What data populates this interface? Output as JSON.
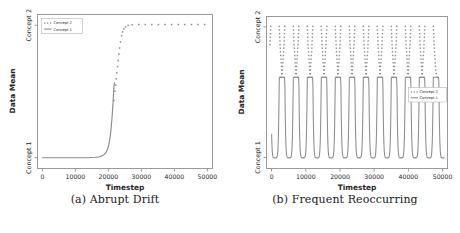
{
  "figure": {
    "panels": [
      {
        "id": "panel-a",
        "caption": "(a) Abrupt Drift",
        "legend_position": "upper-left"
      },
      {
        "id": "panel-b",
        "caption": "(b) Frequent Reoccurring",
        "legend_position": "center-right"
      }
    ]
  },
  "colors": {
    "line": "#8c8c8c",
    "dot": "#8c8c8c",
    "axis": "#9a9a9a",
    "text": "#262626",
    "background": "#ffffff"
  },
  "chart_data": [
    {
      "type": "line",
      "title": "(a) Abrupt Drift",
      "xlabel": "Timestep",
      "ylabel": "Data Mean",
      "xlim": [
        -1500,
        51500
      ],
      "ylim": [
        0,
        1
      ],
      "grid": false,
      "xticks": [
        0,
        10000,
        20000,
        30000,
        40000,
        50000
      ],
      "xticklabels": [
        "0",
        "10000",
        "20000",
        "30000",
        "40000",
        "50000"
      ],
      "yticks": [
        0.07,
        0.93
      ],
      "yticklabels": [
        "Concept 1",
        "Concept 2"
      ],
      "legend": [
        "Concept 2",
        "Concept 1"
      ],
      "legend_position": "upper-left",
      "series": [
        {
          "name": "Concept 1",
          "style": "solid",
          "description": "Flat at Concept 1 until ~21000, then sigmoid rise, truncated at ~25000 near mid-height",
          "x": [
            0,
            2000,
            4000,
            6000,
            8000,
            10000,
            12000,
            14000,
            16000,
            18000,
            19000,
            20000,
            21000,
            21500,
            22000,
            22500,
            23000,
            23400,
            23800,
            24100,
            24400,
            24600,
            24800,
            24950,
            25050
          ],
          "y": [
            0.07,
            0.07,
            0.07,
            0.07,
            0.07,
            0.07,
            0.07,
            0.07,
            0.071,
            0.072,
            0.073,
            0.075,
            0.079,
            0.083,
            0.09,
            0.102,
            0.125,
            0.155,
            0.205,
            0.265,
            0.345,
            0.41,
            0.48,
            0.53,
            0.555
          ]
        },
        {
          "name": "Concept 2",
          "style": "dotted",
          "description": "Dotted sigmoid continuing from ~24500 up to plateau at Concept 2 level across remainder",
          "x": [
            24500,
            24800,
            25000,
            25200,
            25400,
            25600,
            25800,
            26000,
            26200,
            26500,
            26800,
            27100,
            27500,
            28000,
            28800,
            30000,
            32000,
            34000,
            36000,
            38000,
            40000,
            42000,
            44000,
            46000,
            48000,
            50000
          ],
          "y": [
            0.44,
            0.5,
            0.54,
            0.58,
            0.62,
            0.66,
            0.7,
            0.74,
            0.78,
            0.82,
            0.86,
            0.885,
            0.905,
            0.918,
            0.927,
            0.932,
            0.933,
            0.933,
            0.933,
            0.933,
            0.933,
            0.933,
            0.933,
            0.933,
            0.933,
            0.933
          ]
        }
      ]
    },
    {
      "type": "line",
      "title": "(b) Frequent Reoccurring",
      "xlabel": "Timestep",
      "ylabel": "Data Mean",
      "xlim": [
        -1500,
        51500
      ],
      "ylim": [
        0,
        1
      ],
      "grid": false,
      "xticks": [
        0,
        10000,
        20000,
        30000,
        40000,
        50000
      ],
      "xticklabels": [
        "0",
        "10000",
        "20000",
        "30000",
        "40000",
        "50000"
      ],
      "yticks": [
        0.07,
        0.93
      ],
      "yticklabels": [
        "Concept 1",
        "Concept 2"
      ],
      "legend": [
        "Concept 2",
        "Concept 1"
      ],
      "legend_position": "center-right",
      "oscillation": {
        "cycles": 12,
        "period": 4100,
        "first_peak": 1000,
        "solid_top": 0.6,
        "solid_bottom": 0.07,
        "dot_top": 0.935,
        "dot_bottom": 0.6,
        "description": "12 repeating U-shaped troughs in solid Concept 1 line; dotted Concept 2 columns rise above each peak to the Concept 2 plateau level"
      }
    }
  ]
}
